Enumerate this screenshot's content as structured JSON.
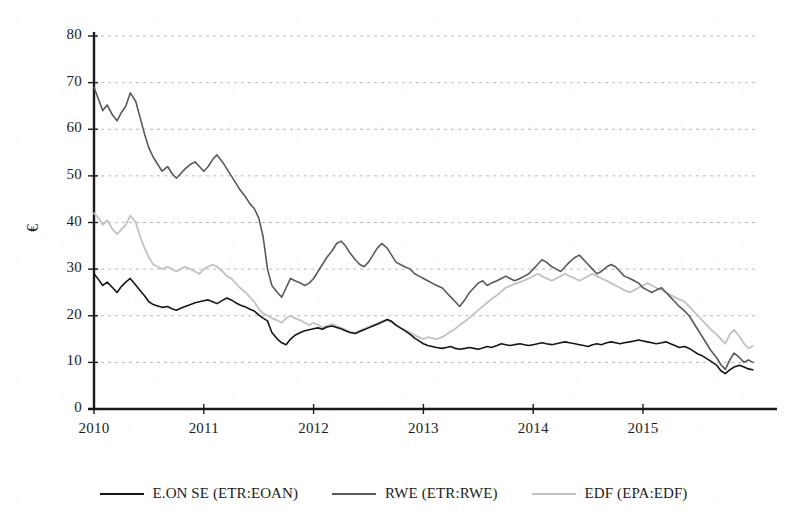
{
  "chart_data": {
    "type": "line",
    "title": "",
    "subtitle": "",
    "xlabel": "",
    "ylabel": "€",
    "ylim": [
      0,
      80
    ],
    "ytick_values": [
      0,
      10,
      20,
      30,
      40,
      50,
      60,
      70,
      80
    ],
    "ytick_labels": [
      "0",
      "10",
      "20",
      "30",
      "40",
      "50",
      "60",
      "70",
      "80"
    ],
    "xlim": [
      2010.0,
      2016.02
    ],
    "xtick_values": [
      2010,
      2011,
      2012,
      2013,
      2014,
      2015
    ],
    "xtick_labels": [
      "2010",
      "2011",
      "2012",
      "2013",
      "2014",
      "2015"
    ],
    "grid": "horizontal-dotted",
    "legend_position": "bottom-center",
    "series": [
      {
        "name": "E.ON SE (ETR:EOAN)",
        "color": "#161616",
        "linewidth": 1.6,
        "x": [
          2010.0,
          2010.04,
          2010.08,
          2010.12,
          2010.17,
          2010.21,
          2010.25,
          2010.29,
          2010.33,
          2010.38,
          2010.42,
          2010.46,
          2010.5,
          2010.54,
          2010.58,
          2010.62,
          2010.67,
          2010.71,
          2010.75,
          2010.79,
          2010.83,
          2010.88,
          2010.92,
          2010.96,
          2011.0,
          2011.04,
          2011.08,
          2011.12,
          2011.17,
          2011.21,
          2011.25,
          2011.29,
          2011.33,
          2011.38,
          2011.42,
          2011.46,
          2011.5,
          2011.54,
          2011.58,
          2011.62,
          2011.67,
          2011.71,
          2011.75,
          2011.79,
          2011.83,
          2011.88,
          2011.92,
          2011.96,
          2012.0,
          2012.04,
          2012.08,
          2012.12,
          2012.17,
          2012.21,
          2012.25,
          2012.29,
          2012.33,
          2012.38,
          2012.42,
          2012.46,
          2012.5,
          2012.54,
          2012.58,
          2012.62,
          2012.67,
          2012.71,
          2012.75,
          2012.79,
          2012.83,
          2012.88,
          2012.92,
          2012.96,
          2013.0,
          2013.04,
          2013.08,
          2013.12,
          2013.17,
          2013.21,
          2013.25,
          2013.29,
          2013.33,
          2013.38,
          2013.42,
          2013.46,
          2013.5,
          2013.54,
          2013.58,
          2013.62,
          2013.67,
          2013.71,
          2013.75,
          2013.79,
          2013.83,
          2013.88,
          2013.92,
          2013.96,
          2014.0,
          2014.04,
          2014.08,
          2014.12,
          2014.17,
          2014.21,
          2014.25,
          2014.29,
          2014.33,
          2014.38,
          2014.42,
          2014.46,
          2014.5,
          2014.54,
          2014.58,
          2014.62,
          2014.67,
          2014.71,
          2014.75,
          2014.79,
          2014.83,
          2014.88,
          2014.92,
          2014.96,
          2015.0,
          2015.04,
          2015.08,
          2015.12,
          2015.17,
          2015.21,
          2015.25,
          2015.29,
          2015.33,
          2015.38,
          2015.42,
          2015.46,
          2015.5,
          2015.54,
          2015.58,
          2015.62,
          2015.67,
          2015.71,
          2015.75,
          2015.79,
          2015.83,
          2015.88,
          2015.92,
          2015.96,
          2016.0
        ],
        "values": [
          29.0,
          27.8,
          26.5,
          27.2,
          26.0,
          25.0,
          26.3,
          27.2,
          28.0,
          26.6,
          25.4,
          24.3,
          23.0,
          22.4,
          22.1,
          21.8,
          22.0,
          21.5,
          21.2,
          21.6,
          22.0,
          22.4,
          22.8,
          23.0,
          23.2,
          23.4,
          23.0,
          22.6,
          23.3,
          23.8,
          23.4,
          22.8,
          22.3,
          21.9,
          21.4,
          21.0,
          20.2,
          19.5,
          18.9,
          16.4,
          15.0,
          14.2,
          13.8,
          15.0,
          15.8,
          16.4,
          16.8,
          17.0,
          17.2,
          17.4,
          17.1,
          17.6,
          17.8,
          17.5,
          17.2,
          16.8,
          16.4,
          16.2,
          16.6,
          17.0,
          17.4,
          17.8,
          18.2,
          18.6,
          19.2,
          18.8,
          18.0,
          17.4,
          16.8,
          16.0,
          15.2,
          14.6,
          14.0,
          13.6,
          13.4,
          13.2,
          13.0,
          13.2,
          13.4,
          13.0,
          12.8,
          13.0,
          13.2,
          13.0,
          12.8,
          13.1,
          13.4,
          13.2,
          13.6,
          14.0,
          13.8,
          13.6,
          13.8,
          14.0,
          13.8,
          13.6,
          13.8,
          14.0,
          14.2,
          14.0,
          13.8,
          14.0,
          14.2,
          14.4,
          14.2,
          14.0,
          13.8,
          13.6,
          13.4,
          13.8,
          14.0,
          13.8,
          14.2,
          14.4,
          14.2,
          14.0,
          14.2,
          14.4,
          14.6,
          14.8,
          14.6,
          14.4,
          14.2,
          14.0,
          14.2,
          14.4,
          14.0,
          13.6,
          13.2,
          13.4,
          13.0,
          12.4,
          11.8,
          11.4,
          10.8,
          10.2,
          9.4,
          8.2,
          7.6,
          8.4,
          9.0,
          9.4,
          9.0,
          8.6,
          8.4
        ]
      },
      {
        "name": "RWE (ETR:RWE)",
        "color": "#595959",
        "linewidth": 1.6,
        "x": [
          2010.0,
          2010.04,
          2010.08,
          2010.12,
          2010.17,
          2010.21,
          2010.25,
          2010.29,
          2010.33,
          2010.38,
          2010.42,
          2010.46,
          2010.5,
          2010.54,
          2010.58,
          2010.62,
          2010.67,
          2010.71,
          2010.75,
          2010.79,
          2010.83,
          2010.88,
          2010.92,
          2010.96,
          2011.0,
          2011.04,
          2011.08,
          2011.12,
          2011.17,
          2011.21,
          2011.25,
          2011.29,
          2011.33,
          2011.38,
          2011.42,
          2011.46,
          2011.5,
          2011.54,
          2011.58,
          2011.62,
          2011.67,
          2011.71,
          2011.75,
          2011.79,
          2011.83,
          2011.88,
          2011.92,
          2011.96,
          2012.0,
          2012.04,
          2012.08,
          2012.12,
          2012.17,
          2012.21,
          2012.25,
          2012.29,
          2012.33,
          2012.38,
          2012.42,
          2012.46,
          2012.5,
          2012.54,
          2012.58,
          2012.62,
          2012.67,
          2012.71,
          2012.75,
          2012.79,
          2012.83,
          2012.88,
          2012.92,
          2012.96,
          2013.0,
          2013.04,
          2013.08,
          2013.12,
          2013.17,
          2013.21,
          2013.25,
          2013.29,
          2013.33,
          2013.38,
          2013.42,
          2013.46,
          2013.5,
          2013.54,
          2013.58,
          2013.62,
          2013.67,
          2013.71,
          2013.75,
          2013.79,
          2013.83,
          2013.88,
          2013.92,
          2013.96,
          2014.0,
          2014.04,
          2014.08,
          2014.12,
          2014.17,
          2014.21,
          2014.25,
          2014.29,
          2014.33,
          2014.38,
          2014.42,
          2014.46,
          2014.5,
          2014.54,
          2014.58,
          2014.62,
          2014.67,
          2014.71,
          2014.75,
          2014.79,
          2014.83,
          2014.88,
          2014.92,
          2014.96,
          2015.0,
          2015.04,
          2015.08,
          2015.12,
          2015.17,
          2015.21,
          2015.25,
          2015.29,
          2015.33,
          2015.38,
          2015.42,
          2015.46,
          2015.5,
          2015.54,
          2015.58,
          2015.62,
          2015.67,
          2015.71,
          2015.75,
          2015.79,
          2015.83,
          2015.88,
          2015.92,
          2015.96,
          2016.0
        ],
        "values": [
          69.0,
          66.5,
          64.0,
          65.2,
          63.0,
          61.8,
          63.6,
          65.0,
          67.8,
          66.0,
          62.5,
          59.0,
          56.0,
          54.0,
          52.5,
          51.0,
          52.0,
          50.5,
          49.5,
          50.5,
          51.5,
          52.5,
          53.0,
          52.0,
          51.0,
          52.0,
          53.5,
          54.5,
          53.0,
          51.5,
          50.0,
          48.5,
          47.0,
          45.5,
          44.0,
          43.0,
          41.0,
          37.0,
          30.0,
          26.5,
          25.0,
          24.0,
          26.0,
          28.0,
          27.5,
          27.0,
          26.5,
          27.0,
          28.0,
          29.5,
          31.0,
          32.5,
          34.0,
          35.5,
          36.0,
          35.0,
          33.5,
          32.0,
          31.0,
          30.5,
          31.5,
          33.0,
          34.5,
          35.5,
          34.5,
          33.0,
          31.5,
          31.0,
          30.5,
          30.0,
          29.0,
          28.5,
          28.0,
          27.5,
          27.0,
          26.5,
          26.0,
          25.0,
          24.0,
          23.0,
          22.0,
          23.5,
          25.0,
          26.0,
          27.0,
          27.5,
          26.5,
          27.0,
          27.5,
          28.0,
          28.5,
          28.0,
          27.5,
          28.0,
          28.5,
          29.0,
          30.0,
          31.0,
          32.0,
          31.5,
          30.5,
          30.0,
          29.5,
          30.5,
          31.5,
          32.5,
          33.0,
          32.0,
          31.0,
          30.0,
          29.0,
          29.5,
          30.5,
          31.0,
          30.5,
          29.5,
          28.5,
          28.0,
          27.5,
          27.0,
          26.0,
          25.5,
          25.0,
          25.5,
          26.0,
          25.0,
          24.0,
          23.0,
          22.0,
          21.0,
          20.0,
          18.5,
          17.0,
          15.5,
          14.0,
          12.5,
          11.0,
          9.5,
          8.5,
          10.5,
          12.0,
          11.0,
          10.0,
          10.5,
          10.0
        ]
      },
      {
        "name": "EDF (EPA:EDF)",
        "color": "#c2c2c2",
        "linewidth": 1.8,
        "x": [
          2010.0,
          2010.04,
          2010.08,
          2010.12,
          2010.17,
          2010.21,
          2010.25,
          2010.29,
          2010.33,
          2010.38,
          2010.42,
          2010.46,
          2010.5,
          2010.54,
          2010.58,
          2010.62,
          2010.67,
          2010.71,
          2010.75,
          2010.79,
          2010.83,
          2010.88,
          2010.92,
          2010.96,
          2011.0,
          2011.04,
          2011.08,
          2011.12,
          2011.17,
          2011.21,
          2011.25,
          2011.29,
          2011.33,
          2011.38,
          2011.42,
          2011.46,
          2011.5,
          2011.54,
          2011.58,
          2011.62,
          2011.67,
          2011.71,
          2011.75,
          2011.79,
          2011.83,
          2011.88,
          2011.92,
          2011.96,
          2012.0,
          2012.04,
          2012.08,
          2012.12,
          2012.17,
          2012.21,
          2012.25,
          2012.29,
          2012.33,
          2012.38,
          2012.42,
          2012.46,
          2012.5,
          2012.54,
          2012.58,
          2012.62,
          2012.67,
          2012.71,
          2012.75,
          2012.79,
          2012.83,
          2012.88,
          2012.92,
          2012.96,
          2013.0,
          2013.04,
          2013.08,
          2013.12,
          2013.17,
          2013.21,
          2013.25,
          2013.29,
          2013.33,
          2013.38,
          2013.42,
          2013.46,
          2013.5,
          2013.54,
          2013.58,
          2013.62,
          2013.67,
          2013.71,
          2013.75,
          2013.79,
          2013.83,
          2013.88,
          2013.92,
          2013.96,
          2014.0,
          2014.04,
          2014.08,
          2014.12,
          2014.17,
          2014.21,
          2014.25,
          2014.29,
          2014.33,
          2014.38,
          2014.42,
          2014.46,
          2014.5,
          2014.54,
          2014.58,
          2014.62,
          2014.67,
          2014.71,
          2014.75,
          2014.79,
          2014.83,
          2014.88,
          2014.92,
          2014.96,
          2015.0,
          2015.04,
          2015.08,
          2015.12,
          2015.17,
          2015.21,
          2015.25,
          2015.29,
          2015.33,
          2015.38,
          2015.42,
          2015.46,
          2015.5,
          2015.54,
          2015.58,
          2015.62,
          2015.67,
          2015.71,
          2015.75,
          2015.79,
          2015.83,
          2015.88,
          2015.92,
          2015.96,
          2016.0
        ],
        "values": [
          42.0,
          41.0,
          39.5,
          40.5,
          38.5,
          37.5,
          38.5,
          39.5,
          41.5,
          40.0,
          37.0,
          34.5,
          32.5,
          31.0,
          30.5,
          30.0,
          30.5,
          30.0,
          29.5,
          30.0,
          30.5,
          30.0,
          29.5,
          29.0,
          30.0,
          30.5,
          31.0,
          30.5,
          29.5,
          28.5,
          28.0,
          27.0,
          26.0,
          25.0,
          24.0,
          23.0,
          21.5,
          20.5,
          20.0,
          19.5,
          19.0,
          18.5,
          19.5,
          20.0,
          19.5,
          19.0,
          18.5,
          18.0,
          18.5,
          18.0,
          17.5,
          17.8,
          18.2,
          17.8,
          17.4,
          17.0,
          16.6,
          16.4,
          16.8,
          17.2,
          17.6,
          18.0,
          18.4,
          18.8,
          19.0,
          18.6,
          18.0,
          17.4,
          17.0,
          16.4,
          15.8,
          15.4,
          15.0,
          15.4,
          15.2,
          15.0,
          15.4,
          16.0,
          16.6,
          17.2,
          18.0,
          18.8,
          19.6,
          20.4,
          21.2,
          22.0,
          22.8,
          23.6,
          24.4,
          25.2,
          26.0,
          26.4,
          26.8,
          27.2,
          27.6,
          28.0,
          28.5,
          29.0,
          28.5,
          28.0,
          27.5,
          28.0,
          28.5,
          29.0,
          28.5,
          28.0,
          27.5,
          28.0,
          28.5,
          29.0,
          28.5,
          28.0,
          27.5,
          27.0,
          26.5,
          26.0,
          25.5,
          25.0,
          25.5,
          26.0,
          26.5,
          27.0,
          26.5,
          26.0,
          25.5,
          25.0,
          24.5,
          24.0,
          23.5,
          23.0,
          22.0,
          21.0,
          20.0,
          19.0,
          18.0,
          17.0,
          16.0,
          15.0,
          14.0,
          16.0,
          17.0,
          15.5,
          14.0,
          13.0,
          13.5
        ]
      }
    ]
  },
  "legend": {
    "items": [
      {
        "label": "E.ON SE (ETR:EOAN)",
        "color": "#161616"
      },
      {
        "label": "RWE (ETR:RWE)",
        "color": "#595959"
      },
      {
        "label": "EDF (EPA:EDF)",
        "color": "#c2c2c2"
      }
    ]
  }
}
